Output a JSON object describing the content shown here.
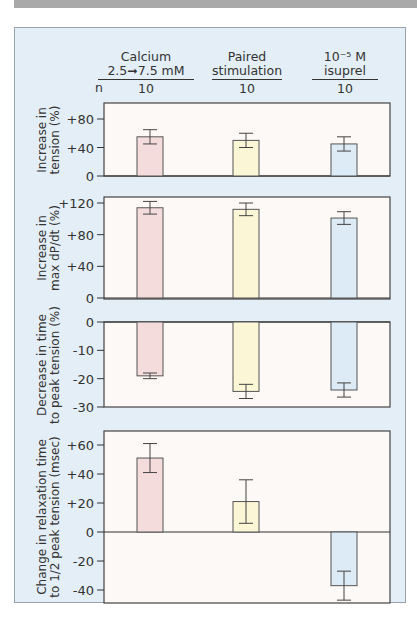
{
  "header": {
    "n_label": "n",
    "groups": [
      {
        "line1": "Calcium",
        "line2": "2.5➞7.5 mM",
        "n": "10"
      },
      {
        "line1": "Paired",
        "line2": "stimulation",
        "n": "10"
      },
      {
        "line1": "10⁻⁵ M",
        "line2": "isuprel",
        "n": "10"
      }
    ]
  },
  "colors": {
    "calcium": "#f5dcdc",
    "paired": "#faf6d6",
    "isuprel": "#dcebf5",
    "frame_bg": "#e4eef7",
    "plot_bg": "#fdf9f6",
    "topbar": "#a9a9a9"
  },
  "chart_data": [
    {
      "type": "bar",
      "title": "",
      "ylabel": "Increase in tension (%)",
      "categories": [
        "Calcium 2.5→7.5 mM",
        "Paired stimulation",
        "10^-5 M isuprel"
      ],
      "values": [
        55,
        50,
        45
      ],
      "errors": [
        10,
        10,
        10
      ],
      "yticks": [
        "0",
        "+40",
        "+80"
      ],
      "ylim": [
        0,
        100
      ]
    },
    {
      "type": "bar",
      "ylabel": "Increase in max dP/dt (%)",
      "categories": [
        "Calcium 2.5→7.5 mM",
        "Paired stimulation",
        "10^-5 M isuprel"
      ],
      "values": [
        114,
        112,
        101
      ],
      "errors": [
        8,
        8,
        8
      ],
      "yticks": [
        "0",
        "+40",
        "+80",
        "+120"
      ],
      "ylim": [
        0,
        125
      ]
    },
    {
      "type": "bar",
      "ylabel": "Decrease in time to peak tension (%)",
      "categories": [
        "Calcium 2.5→7.5 mM",
        "Paired stimulation",
        "10^-5 M isuprel"
      ],
      "values": [
        -19,
        -24.5,
        -24
      ],
      "errors": [
        1,
        2.5,
        2.5
      ],
      "yticks": [
        "0",
        "-10",
        "-20",
        "-30"
      ],
      "ylim": [
        -30,
        0
      ]
    },
    {
      "type": "bar",
      "ylabel": "Change in relaxation time to 1/2 peak tension (msec)",
      "categories": [
        "Calcium 2.5→7.5 mM",
        "Paired stimulation",
        "10^-5 M isuprel"
      ],
      "values": [
        51,
        21,
        -37
      ],
      "errors": [
        10,
        15,
        10
      ],
      "yticks": [
        "-40",
        "-20",
        "0",
        "+20",
        "+40",
        "+60"
      ],
      "ylim": [
        -50,
        68
      ]
    }
  ]
}
